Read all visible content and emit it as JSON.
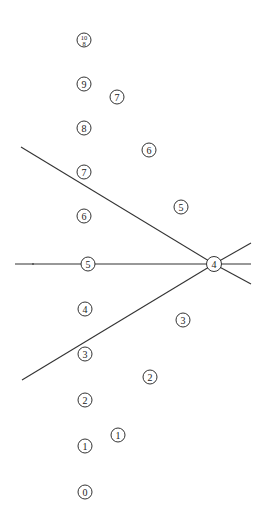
{
  "diagram": {
    "line_color": "#333333",
    "nodes": [
      {
        "id": "left-10-8",
        "label_top": "10",
        "label_bottom": "8",
        "column": "left"
      },
      {
        "id": "left-9",
        "label": "9",
        "column": "left"
      },
      {
        "id": "left-8",
        "label": "8",
        "column": "left"
      },
      {
        "id": "left-7",
        "label": "7",
        "column": "left"
      },
      {
        "id": "left-6",
        "label": "6",
        "column": "left"
      },
      {
        "id": "left-5",
        "label": "5",
        "column": "left"
      },
      {
        "id": "left-4",
        "label": "4",
        "column": "left"
      },
      {
        "id": "left-3",
        "label": "3",
        "column": "left"
      },
      {
        "id": "left-2",
        "label": "2",
        "column": "left"
      },
      {
        "id": "left-1",
        "label": "1",
        "column": "left"
      },
      {
        "id": "left-0",
        "label": "0",
        "column": "left"
      },
      {
        "id": "right-7",
        "label": "7",
        "column": "diagonal"
      },
      {
        "id": "right-6",
        "label": "6",
        "column": "diagonal"
      },
      {
        "id": "right-5",
        "label": "5",
        "column": "diagonal"
      },
      {
        "id": "right-4",
        "label": "4",
        "column": "hub"
      },
      {
        "id": "right-3",
        "label": "3",
        "column": "diagonal"
      },
      {
        "id": "right-2",
        "label": "2",
        "column": "diagonal"
      },
      {
        "id": "right-1",
        "label": "1",
        "column": "diagonal"
      }
    ],
    "lines": [
      {
        "id": "upper-diagonal",
        "from": "upper-left",
        "to": "right-4"
      },
      {
        "id": "horizontal",
        "from": "left-edge",
        "to": "right-4",
        "through": "left-5"
      },
      {
        "id": "lower-diagonal",
        "from": "lower-left",
        "to": "right-4"
      },
      {
        "id": "ray-upper-right",
        "from": "right-4",
        "to": "upper-right"
      },
      {
        "id": "ray-right",
        "from": "right-4",
        "to": "right-edge"
      },
      {
        "id": "ray-lower-right",
        "from": "right-4",
        "to": "lower-right"
      }
    ]
  }
}
